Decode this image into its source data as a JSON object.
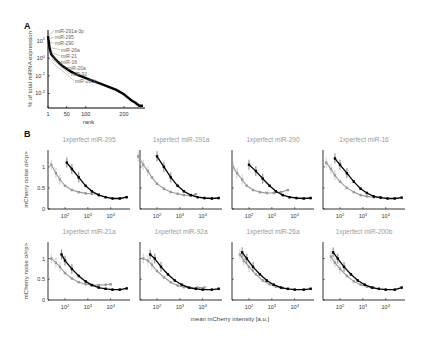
{
  "figure": {
    "panel_a_letter": "A",
    "panel_b_letter": "B"
  },
  "chart_data": [
    {
      "type": "scatter",
      "panel": "A",
      "title": "",
      "xlabel": "rank",
      "ylabel": "% of total miRNA expression",
      "yscale": "log",
      "xticks": [
        "1",
        "50",
        "100",
        "200"
      ],
      "yticks": [
        "10^1",
        "10^0",
        "10^-1",
        "10^-2"
      ],
      "xlim": [
        1,
        250
      ],
      "ylim": [
        0.001,
        50
      ],
      "annotations": [
        "miR-291a-3p",
        "miR-295",
        "miR-290",
        "miR-26a",
        "miR-21",
        "miR-16",
        "miR-20a",
        "miR-92",
        "miR-200b"
      ],
      "series": [
        {
          "name": "miRNA expression",
          "color": "#000000",
          "x": [
            1,
            2,
            3,
            5,
            8,
            10,
            15,
            20,
            30,
            40,
            50,
            60,
            80,
            100,
            120,
            140,
            160,
            180,
            200,
            210,
            220,
            230,
            240,
            250
          ],
          "y": [
            18,
            12,
            9,
            4,
            2.2,
            1.6,
            1.2,
            0.9,
            0.55,
            0.35,
            0.25,
            0.18,
            0.11,
            0.075,
            0.05,
            0.035,
            0.024,
            0.016,
            0.009,
            0.006,
            0.004,
            0.003,
            0.002,
            0.002
          ]
        }
      ]
    },
    {
      "type": "scatter",
      "panel": "B",
      "xlabel": "mean mCherry intensity [a.u.]",
      "ylabel": "mCherry noise σ/<p>",
      "xscale": "log",
      "xticks": [
        "10^2",
        "10^3",
        "10^4"
      ],
      "yticks": [
        "0",
        "0.5",
        "1"
      ],
      "ylim": [
        0,
        1.4
      ],
      "subplots": [
        {
          "title": "1xperfect miR-295",
          "series": [
            {
              "name": "control",
              "color": "#000000",
              "x": [
                120,
                200,
                400,
                800,
                1500,
                3000,
                6000,
                12000,
                25000,
                50000
              ],
              "y": [
                1.1,
                0.95,
                0.75,
                0.55,
                0.42,
                0.33,
                0.28,
                0.25,
                0.25,
                0.28
              ]
            },
            {
              "name": "targeted",
              "color": "#999999",
              "x": [
                25,
                40,
                60,
                100,
                200,
                400,
                800,
                1500,
                3000
              ],
              "y": [
                1.05,
                0.85,
                0.7,
                0.55,
                0.45,
                0.4,
                0.37,
                0.36,
                0.35
              ]
            }
          ]
        },
        {
          "title": "1xperfect miR-291a",
          "series": [
            {
              "name": "control",
              "color": "#000000",
              "x": [
                100,
                200,
                400,
                800,
                1500,
                3000,
                6000,
                12000,
                25000,
                50000
              ],
              "y": [
                1.25,
                1.0,
                0.75,
                0.55,
                0.42,
                0.33,
                0.28,
                0.26,
                0.25,
                0.26
              ]
            },
            {
              "name": "targeted",
              "color": "#999999",
              "x": [
                15,
                25,
                40,
                60,
                100,
                200,
                400,
                800,
                1500,
                3000,
                5000
              ],
              "y": [
                1.25,
                1.05,
                0.9,
                0.75,
                0.6,
                0.48,
                0.4,
                0.36,
                0.33,
                0.32,
                0.35
              ]
            }
          ]
        },
        {
          "title": "1xperfect miR-290",
          "series": [
            {
              "name": "control",
              "color": "#000000",
              "x": [
                100,
                200,
                400,
                800,
                1500,
                3000,
                6000,
                12000,
                25000,
                50000
              ],
              "y": [
                1.05,
                0.9,
                0.72,
                0.55,
                0.42,
                0.33,
                0.28,
                0.26,
                0.25,
                0.26
              ]
            },
            {
              "name": "targeted",
              "color": "#999999",
              "x": [
                20,
                30,
                50,
                80,
                150,
                300,
                600,
                1200,
                2500,
                5000
              ],
              "y": [
                1.0,
                0.85,
                0.7,
                0.55,
                0.45,
                0.4,
                0.38,
                0.38,
                0.4,
                0.45
              ]
            }
          ]
        },
        {
          "title": "1xperfect miR-16",
          "series": [
            {
              "name": "control",
              "color": "#000000",
              "x": [
                60,
                100,
                200,
                400,
                800,
                1500,
                3000,
                6000,
                12000,
                25000,
                50000
              ],
              "y": [
                1.2,
                1.05,
                0.85,
                0.65,
                0.48,
                0.38,
                0.3,
                0.27,
                0.25,
                0.25,
                0.27
              ]
            },
            {
              "name": "targeted",
              "color": "#999999",
              "x": [
                25,
                40,
                60,
                100,
                200,
                400,
                800,
                1500,
                3000,
                6000
              ],
              "y": [
                1.1,
                0.95,
                0.8,
                0.65,
                0.5,
                0.4,
                0.33,
                0.3,
                0.28,
                0.28
              ]
            }
          ]
        },
        {
          "title": "1xperfect miR-21a",
          "series": [
            {
              "name": "control",
              "color": "#000000",
              "x": [
                70,
                100,
                200,
                400,
                800,
                1500,
                3000,
                6000,
                12000,
                25000,
                50000
              ],
              "y": [
                1.1,
                0.95,
                0.75,
                0.58,
                0.45,
                0.36,
                0.3,
                0.27,
                0.25,
                0.25,
                0.28
              ]
            },
            {
              "name": "targeted",
              "color": "#999999",
              "x": [
                25,
                40,
                60,
                100,
                200,
                400,
                800,
                1500,
                3000,
                6000,
                10000
              ],
              "y": [
                1.0,
                0.9,
                0.8,
                0.65,
                0.52,
                0.43,
                0.38,
                0.36,
                0.36,
                0.37,
                0.38
              ]
            }
          ]
        },
        {
          "title": "1xperfect miR-92a",
          "series": [
            {
              "name": "control",
              "color": "#000000",
              "x": [
                50,
                80,
                150,
                300,
                600,
                1200,
                2500,
                5000,
                10000,
                25000,
                50000
              ],
              "y": [
                1.1,
                1.0,
                0.8,
                0.62,
                0.47,
                0.37,
                0.3,
                0.27,
                0.25,
                0.25,
                0.27
              ]
            },
            {
              "name": "targeted",
              "color": "#999999",
              "x": [
                25,
                40,
                60,
                100,
                200,
                400,
                800,
                1500,
                3000,
                6000,
                12000
              ],
              "y": [
                1.0,
                0.95,
                0.85,
                0.7,
                0.55,
                0.43,
                0.35,
                0.31,
                0.29,
                0.3,
                0.3
              ]
            }
          ]
        },
        {
          "title": "1xperfect miR-26a",
          "series": [
            {
              "name": "control",
              "color": "#000000",
              "x": [
                50,
                80,
                150,
                300,
                600,
                1200,
                2500,
                5000,
                10000,
                25000,
                50000
              ],
              "y": [
                1.15,
                1.0,
                0.8,
                0.62,
                0.47,
                0.37,
                0.3,
                0.27,
                0.25,
                0.25,
                0.27
              ]
            },
            {
              "name": "targeted",
              "color": "#999999",
              "x": [
                40,
                60,
                100,
                200,
                400,
                800,
                1500,
                3000
              ],
              "y": [
                1.1,
                0.95,
                0.8,
                0.62,
                0.47,
                0.38,
                0.32,
                0.29
              ]
            }
          ]
        },
        {
          "title": "1xperfect miR-200b",
          "series": [
            {
              "name": "control",
              "color": "#000000",
              "x": [
                50,
                80,
                150,
                300,
                600,
                1200,
                2500,
                5000,
                10000,
                25000,
                50000
              ],
              "y": [
                1.15,
                1.0,
                0.8,
                0.62,
                0.47,
                0.37,
                0.3,
                0.27,
                0.25,
                0.25,
                0.3
              ]
            },
            {
              "name": "targeted",
              "color": "#999999",
              "x": [
                40,
                60,
                100,
                200,
                400,
                800,
                1500,
                3000
              ],
              "y": [
                1.05,
                0.9,
                0.75,
                0.58,
                0.45,
                0.37,
                0.32,
                0.3
              ]
            }
          ]
        }
      ]
    }
  ]
}
